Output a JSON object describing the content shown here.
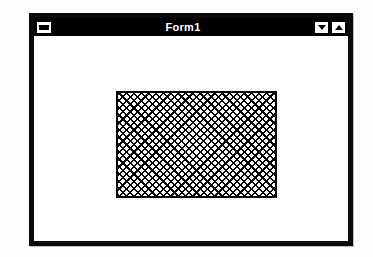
{
  "window": {
    "title": "Form1",
    "title_bar_color": "#000000",
    "title_text_color": "#ffffff",
    "border_color": "#000000",
    "client_background": "#ffffff",
    "sysmenu": {
      "name": "system-menu-button",
      "icon": "minimize-bar-icon",
      "label": ""
    },
    "buttons": [
      {
        "name": "minimize-button",
        "icon": "triangle-down-icon",
        "label": ""
      },
      {
        "name": "maximize-button",
        "icon": "triangle-up-icon",
        "label": ""
      }
    ]
  },
  "client": {
    "shape": {
      "name": "hatched-rectangle-shape",
      "fill_style": "diagonal-cross-hatch",
      "fill_color": "#000000",
      "back_color": "#ffffff",
      "border_color": "#000000"
    }
  }
}
